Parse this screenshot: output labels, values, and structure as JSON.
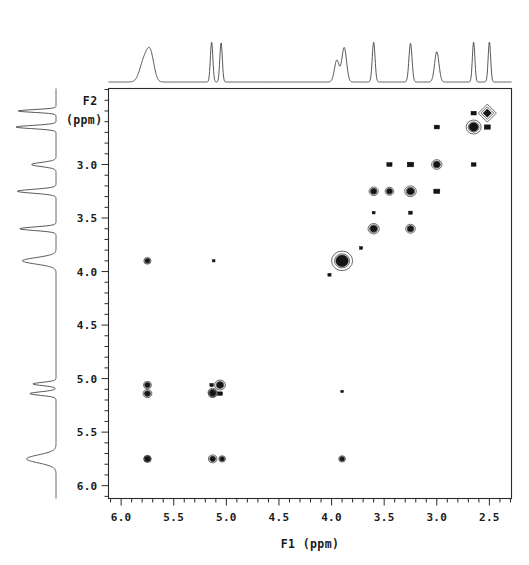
{
  "figure": {
    "kind": "2d-cosy-nmr-contour-plot",
    "background_color": "#ffffff",
    "ink_color": "#151515"
  },
  "axes": {
    "x": {
      "label": "F1  (ppm)",
      "tick_labels": [
        "6.0",
        "5.5",
        "5.0",
        "4.5",
        "4.0",
        "3.5",
        "3.0",
        "2.5"
      ],
      "tick_values": [
        6.0,
        5.5,
        5.0,
        4.5,
        4.0,
        3.5,
        3.0,
        2.5
      ],
      "range": [
        6.12,
        2.29
      ],
      "minor_tick_step": 0.1,
      "direction": "decreasing-left-to-right"
    },
    "y": {
      "label_line1": "F2",
      "label_line2": "(ppm)",
      "tick_labels": [
        "3.0",
        "3.5",
        "4.0",
        "4.5",
        "5.0",
        "5.5",
        "6.0"
      ],
      "tick_values": [
        3.0,
        3.5,
        4.0,
        4.5,
        5.0,
        5.5,
        6.0
      ],
      "range": [
        2.29,
        6.12
      ],
      "minor_tick_step": 0.1,
      "direction": "increasing-top-to-bottom"
    }
  },
  "chart_data": {
    "type": "scatter",
    "title": "",
    "xlabel": "F1  (ppm)",
    "ylabel": "F2 (ppm)",
    "xlim": [
      6.12,
      2.29
    ],
    "ylim": [
      2.29,
      6.12
    ],
    "grid": false,
    "legend": "none",
    "series": [
      {
        "name": "diagonal-peaks",
        "points": [
          {
            "x": 2.52,
            "y": 2.52,
            "size": 9.0,
            "shape": "diamond"
          },
          {
            "x": 2.65,
            "y": 2.65,
            "size": 7.5,
            "shape": "blob"
          },
          {
            "x": 3.0,
            "y": 3.0,
            "size": 5.2,
            "shape": "blob"
          },
          {
            "x": 3.25,
            "y": 3.25,
            "size": 5.8,
            "shape": "blob"
          },
          {
            "x": 3.6,
            "y": 3.6,
            "size": 5.6,
            "shape": "blob"
          },
          {
            "x": 3.9,
            "y": 3.9,
            "size": 10.5,
            "shape": "blob"
          },
          {
            "x": 5.06,
            "y": 5.06,
            "size": 5.4,
            "shape": "blob"
          },
          {
            "x": 5.13,
            "y": 5.13,
            "size": 4.6,
            "shape": "blob"
          },
          {
            "x": 5.75,
            "y": 5.75,
            "size": 3.8,
            "shape": "blob"
          }
        ]
      },
      {
        "name": "cross-peaks",
        "points": [
          {
            "x": 2.52,
            "y": 2.65,
            "size": 3.0,
            "shape": "square"
          },
          {
            "x": 2.65,
            "y": 2.52,
            "size": 2.6,
            "shape": "square"
          },
          {
            "x": 3.0,
            "y": 2.65,
            "size": 2.6,
            "shape": "square"
          },
          {
            "x": 2.65,
            "y": 3.0,
            "size": 2.4,
            "shape": "square"
          },
          {
            "x": 3.25,
            "y": 3.0,
            "size": 3.2,
            "shape": "square"
          },
          {
            "x": 3.0,
            "y": 3.25,
            "size": 3.0,
            "shape": "square"
          },
          {
            "x": 3.45,
            "y": 3.0,
            "size": 2.6,
            "shape": "square"
          },
          {
            "x": 3.6,
            "y": 3.25,
            "size": 4.6,
            "shape": "blob"
          },
          {
            "x": 3.25,
            "y": 3.6,
            "size": 4.8,
            "shape": "blob"
          },
          {
            "x": 3.45,
            "y": 3.25,
            "size": 4.3,
            "shape": "blob"
          },
          {
            "x": 3.25,
            "y": 3.45,
            "size": 2.2,
            "shape": "dot"
          },
          {
            "x": 3.6,
            "y": 3.45,
            "size": 1.8,
            "shape": "dot"
          },
          {
            "x": 3.72,
            "y": 3.78,
            "size": 1.9,
            "shape": "dot"
          },
          {
            "x": 4.02,
            "y": 4.03,
            "size": 2.0,
            "shape": "dot"
          },
          {
            "x": 5.75,
            "y": 3.9,
            "size": 3.6,
            "shape": "blob"
          },
          {
            "x": 5.12,
            "y": 3.9,
            "size": 1.6,
            "shape": "dot"
          },
          {
            "x": 5.75,
            "y": 5.06,
            "size": 4.0,
            "shape": "blob"
          },
          {
            "x": 5.75,
            "y": 5.14,
            "size": 4.4,
            "shape": "blob"
          },
          {
            "x": 5.13,
            "y": 5.14,
            "size": 4.2,
            "shape": "blob"
          },
          {
            "x": 5.06,
            "y": 5.14,
            "size": 2.4,
            "shape": "square"
          },
          {
            "x": 5.14,
            "y": 5.06,
            "size": 2.2,
            "shape": "dot"
          },
          {
            "x": 3.9,
            "y": 5.12,
            "size": 1.6,
            "shape": "dot"
          },
          {
            "x": 5.75,
            "y": 5.75,
            "size": 3.4,
            "shape": "blob"
          },
          {
            "x": 5.13,
            "y": 5.75,
            "size": 4.2,
            "shape": "blob"
          },
          {
            "x": 5.04,
            "y": 5.75,
            "size": 3.4,
            "shape": "blob"
          },
          {
            "x": 3.9,
            "y": 5.75,
            "size": 3.4,
            "shape": "blob"
          }
        ]
      }
    ]
  },
  "projections": {
    "top": {
      "name": "f1-1d-projection",
      "peaks": [
        {
          "ppm": 5.78,
          "height": 0.52,
          "width": 0.055
        },
        {
          "ppm": 5.72,
          "height": 0.6,
          "width": 0.045
        },
        {
          "ppm": 5.14,
          "height": 0.95,
          "width": 0.016
        },
        {
          "ppm": 5.05,
          "height": 0.93,
          "width": 0.016
        },
        {
          "ppm": 3.95,
          "height": 0.52,
          "width": 0.03
        },
        {
          "ppm": 3.88,
          "height": 0.82,
          "width": 0.03
        },
        {
          "ppm": 3.6,
          "height": 0.95,
          "width": 0.018
        },
        {
          "ppm": 3.25,
          "height": 0.92,
          "width": 0.02
        },
        {
          "ppm": 3.0,
          "height": 0.72,
          "width": 0.028
        },
        {
          "ppm": 2.65,
          "height": 0.95,
          "width": 0.016
        },
        {
          "ppm": 2.5,
          "height": 0.95,
          "width": 0.016
        }
      ]
    },
    "left": {
      "name": "f2-1d-projection",
      "peaks": [
        {
          "ppm": 2.5,
          "height": 0.9,
          "width": 0.017
        },
        {
          "ppm": 2.65,
          "height": 0.95,
          "width": 0.02
        },
        {
          "ppm": 3.0,
          "height": 0.58,
          "width": 0.026
        },
        {
          "ppm": 3.25,
          "height": 0.92,
          "width": 0.024
        },
        {
          "ppm": 3.6,
          "height": 0.86,
          "width": 0.022
        },
        {
          "ppm": 3.9,
          "height": 0.8,
          "width": 0.04
        },
        {
          "ppm": 5.05,
          "height": 0.55,
          "width": 0.02
        },
        {
          "ppm": 5.14,
          "height": 0.62,
          "width": 0.022
        },
        {
          "ppm": 5.75,
          "height": 0.7,
          "width": 0.05
        }
      ]
    }
  }
}
